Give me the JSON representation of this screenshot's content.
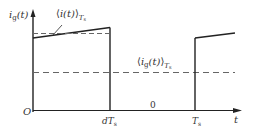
{
  "diagram": {
    "type": "waveform",
    "colors": {
      "line": "#222222",
      "dashed": "#666666",
      "text": "#333333",
      "background": "#ffffff"
    },
    "labels": {
      "y_axis": {
        "main": "i",
        "sub": "g",
        "arg": "(t)"
      },
      "avg_i": {
        "open": "⟨",
        "main": "i(t)",
        "close": "⟩",
        "sub": "T",
        "subsub": "s"
      },
      "avg_ig": {
        "open": "⟨",
        "main": "i",
        "sub1": "g",
        "arg": "(t)",
        "close": "⟩",
        "sub": "T",
        "subsub": "s"
      },
      "origin": "O",
      "dTs": {
        "main": "dT",
        "sub": "s"
      },
      "zero": "0",
      "Ts": {
        "main": "T",
        "sub": "s"
      },
      "t_axis": "t"
    }
  }
}
